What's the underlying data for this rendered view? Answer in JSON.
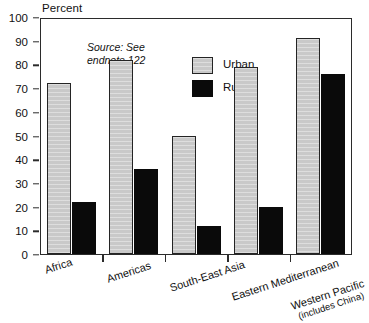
{
  "chart_data": {
    "type": "bar",
    "title": "",
    "subtitle": "",
    "xlabel": "",
    "ylabel": "Percent",
    "ylim": [
      0,
      100
    ],
    "ytick_step": 10,
    "yticks": [
      0,
      10,
      20,
      30,
      40,
      50,
      60,
      70,
      80,
      90,
      100
    ],
    "grid": false,
    "legend_position": "top-center",
    "categories": [
      "Africa",
      "Americas",
      "South-East Asia",
      "Eastern Mediterranean",
      "Western Pacific"
    ],
    "category_sublabels": [
      "",
      "",
      "",
      "",
      "(includes China)"
    ],
    "series": [
      {
        "name": "Urban",
        "color": "#c9c9c9",
        "values": [
          72,
          82,
          50,
          79,
          91
        ]
      },
      {
        "name": "Rural",
        "color": "#0a0a0a",
        "values": [
          22,
          36,
          12,
          20,
          76
        ]
      }
    ],
    "annotations": [
      {
        "name": "source-note",
        "text": "Source: See\nendnote 122"
      }
    ]
  },
  "axis": {
    "y_title": "Percent"
  },
  "source": {
    "text": "Source: See\nendnote 122"
  },
  "legend": {
    "items": [
      {
        "label": "Urban",
        "swatch": "urban-swatch"
      },
      {
        "label": "Rural",
        "swatch": "rural-swatch"
      }
    ]
  },
  "colors": {
    "urban": "#c9c9c9",
    "rural": "#0a0a0a",
    "axis": "#2b2b2b",
    "background": "#ffffff"
  }
}
